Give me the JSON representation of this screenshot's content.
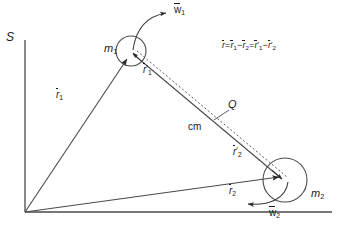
{
  "figure": {
    "type": "two-body-vector-diagram",
    "reference_frame_label": "S",
    "background_color": "#ffffff",
    "line_color": "#3a3a3a",
    "text_color": "#1a1a1a"
  },
  "bodies": [
    {
      "id": "m1",
      "label": "m",
      "subscript": "1",
      "center": [
        131,
        51
      ],
      "radius": 15,
      "spin_label_vector": "w",
      "spin_label_sub": "1"
    },
    {
      "id": "m2",
      "label": "m",
      "subscript": "2",
      "center": [
        285,
        180
      ],
      "radius": 22,
      "spin_label_vector": "w",
      "spin_label_sub": "2"
    }
  ],
  "labels": {
    "frame": "S",
    "m1": "m",
    "m1_sub": "1",
    "m2": "m",
    "m2_sub": "2",
    "w1": "w",
    "w1_sub": "1",
    "w2": "w",
    "w2_sub": "2",
    "r1": "r",
    "r1_sub": "1",
    "r2": "r",
    "r2_sub": "2",
    "r1p": "r",
    "r1p_sub": "1",
    "r2p": "r",
    "r2p_sub": "2",
    "prime": "′",
    "cm": "cm",
    "Q": "Q"
  },
  "equation": {
    "full_text": "r̄ = r̄1 − r̄2 = r̄′1 − r̄′2",
    "terms": [
      {
        "vec": "r",
        "sub": "",
        "prime": false
      },
      {
        "op": "="
      },
      {
        "vec": "r",
        "sub": "1",
        "prime": false
      },
      {
        "op": "−"
      },
      {
        "vec": "r",
        "sub": "2",
        "prime": false
      },
      {
        "op": "="
      },
      {
        "vec": "r",
        "sub": "1",
        "prime": true
      },
      {
        "op": "−"
      },
      {
        "vec": "r",
        "sub": "2",
        "prime": true
      }
    ],
    "equals": "=",
    "minus": "−",
    "position": [
      222,
      47
    ]
  },
  "geometry": {
    "origin": [
      25,
      212
    ],
    "axis_vertical_top": [
      25,
      40
    ],
    "axis_horizontal_right": [
      330,
      212
    ],
    "vector_r1": {
      "from": [
        25,
        212
      ],
      "to": [
        128,
        58
      ]
    },
    "vector_r2": {
      "from": [
        25,
        212
      ],
      "to": [
        281,
        177
      ]
    },
    "line_m1_to_m2": {
      "from": [
        131,
        51
      ],
      "to": [
        285,
        180
      ]
    },
    "dashed_line": {
      "from": [
        136,
        56
      ],
      "to": [
        288,
        184
      ]
    },
    "point_cm_label": [
      196,
      128
    ],
    "point_Q_label": [
      232,
      106
    ]
  }
}
